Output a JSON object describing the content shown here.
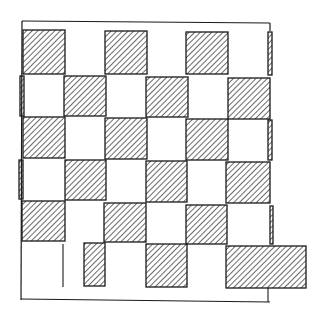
{
  "diagram": {
    "title": "",
    "type": "hand-drawn checkerboard sketch",
    "colors": {
      "ink": "#1a1a1a",
      "background": "#ffffff"
    },
    "border": {
      "x1": 22,
      "y1": 21,
      "x2": 270,
      "y2": 300
    },
    "hatched_squares": [
      {
        "x": 23,
        "y": 30,
        "w": 42,
        "h": 44
      },
      {
        "x": 105,
        "y": 31,
        "w": 42,
        "h": 43
      },
      {
        "x": 186,
        "y": 32,
        "w": 42,
        "h": 42
      },
      {
        "x": 268,
        "y": 32,
        "w": 4,
        "h": 43
      },
      {
        "x": 20,
        "y": 76,
        "w": 4,
        "h": 40
      },
      {
        "x": 64,
        "y": 76,
        "w": 42,
        "h": 40
      },
      {
        "x": 146,
        "y": 77,
        "w": 42,
        "h": 40
      },
      {
        "x": 228,
        "y": 78,
        "w": 42,
        "h": 41
      },
      {
        "x": 23,
        "y": 117,
        "w": 42,
        "h": 41
      },
      {
        "x": 105,
        "y": 118,
        "w": 42,
        "h": 41
      },
      {
        "x": 186,
        "y": 119,
        "w": 42,
        "h": 41
      },
      {
        "x": 268,
        "y": 120,
        "w": 4,
        "h": 40
      },
      {
        "x": 19,
        "y": 160,
        "w": 4,
        "h": 39
      },
      {
        "x": 65,
        "y": 160,
        "w": 41,
        "h": 40
      },
      {
        "x": 146,
        "y": 161,
        "w": 41,
        "h": 41
      },
      {
        "x": 226,
        "y": 162,
        "w": 44,
        "h": 41
      },
      {
        "x": 22,
        "y": 201,
        "w": 43,
        "h": 40
      },
      {
        "x": 104,
        "y": 203,
        "w": 42,
        "h": 39
      },
      {
        "x": 186,
        "y": 205,
        "w": 41,
        "h": 39
      },
      {
        "x": 270,
        "y": 206,
        "w": 3,
        "h": 38
      },
      {
        "x": 84,
        "y": 243,
        "w": 21,
        "h": 43
      },
      {
        "x": 146,
        "y": 244,
        "w": 41,
        "h": 43
      },
      {
        "x": 226,
        "y": 246,
        "w": 80,
        "h": 42
      }
    ],
    "extra_lines": [
      {
        "x1": 63,
        "y1": 244,
        "x2": 63,
        "y2": 287
      },
      {
        "x1": 268,
        "y1": 288,
        "x2": 268,
        "y2": 302
      }
    ]
  }
}
